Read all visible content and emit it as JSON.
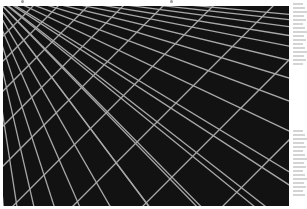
{
  "figure": {
    "background_color": "#121212",
    "line_color": "#a8a8a8",
    "vanishing_point": {
      "x": -20,
      "y": -20
    }
  },
  "margin_text": {
    "upper_block_lines": 16,
    "lower_block_lines": 17,
    "legible": false
  }
}
